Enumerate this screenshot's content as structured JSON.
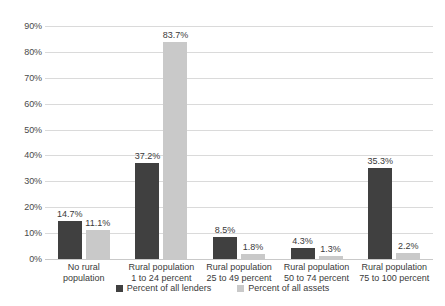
{
  "chart_data": {
    "type": "bar",
    "title": "",
    "subtitle": "",
    "xlabel": "",
    "ylabel": "",
    "ylim": [
      0,
      90
    ],
    "ytick_step": 10,
    "ytick_labels": [
      "90%",
      "80%",
      "70%",
      "60%",
      "50%",
      "40%",
      "30%",
      "20%",
      "10%",
      "0%"
    ],
    "grid": true,
    "legend_position": "bottom-center",
    "categories": [
      "No rural population",
      "Rural population 1 to 24 percent",
      "Rural population 25 to 49 percent",
      "Rural population 50 to 74 percent",
      "Rural population 75 to 100 percent"
    ],
    "category_lines": [
      [
        "No rural",
        "population"
      ],
      [
        "Rural population",
        "1 to 24 percent"
      ],
      [
        "Rural population",
        "25 to 49 percent"
      ],
      [
        "Rural population",
        "50 to 74 percent"
      ],
      [
        "Rural population",
        "75 to 100 percent"
      ]
    ],
    "series": [
      {
        "name": "Percent of all lenders",
        "color": "#404040",
        "values": [
          14.7,
          37.2,
          8.5,
          4.3,
          35.3
        ],
        "labels": [
          "14.7%",
          "37.2%",
          "8.5%",
          "4.3%",
          "35.3%"
        ]
      },
      {
        "name": "Percent of all assets",
        "color": "#c9c9c9",
        "values": [
          11.1,
          83.7,
          1.8,
          1.3,
          2.2
        ],
        "labels": [
          "11.1%",
          "83.7%",
          "1.8%",
          "1.3%",
          "2.2%"
        ]
      }
    ]
  },
  "legend": {
    "items": [
      {
        "label": "Percent of all lenders",
        "swatch": "lenders"
      },
      {
        "label": "Percent of all assets",
        "swatch": "assets"
      }
    ]
  },
  "colors": {
    "lenders": "#404040",
    "assets": "#c9c9c9",
    "gridline": "#dadada",
    "text": "#3a3a3a",
    "background": "#ffffff"
  }
}
